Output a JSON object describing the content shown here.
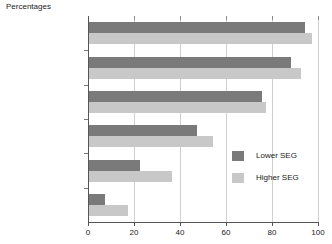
{
  "chart_data": {
    "type": "bar",
    "orientation": "horizontal",
    "title": "Percentages",
    "xlabel": "",
    "ylabel": "",
    "xlim": [
      0,
      100
    ],
    "xticks": [
      0,
      20,
      40,
      60,
      80,
      100
    ],
    "xtick_labels": [
      "0",
      "20",
      "40",
      "60",
      "80",
      "100"
    ],
    "grid": true,
    "legend_position": "inside-right",
    "categories": [
      "A level points 25 or more",
      "A level points 13 to 24",
      "A level points 12 or less",
      "Vocational Level 3",
      "Level 2",
      "Lower than Level 2"
    ],
    "category_lines": [
      [
        "A level points 25",
        "or more"
      ],
      [
        "A level points 13",
        "to 24"
      ],
      [
        "A level points 12",
        "or less"
      ],
      [
        "Vocational Level 3"
      ],
      [
        "Level 2"
      ],
      [
        "Lower than Level 2"
      ]
    ],
    "series": [
      {
        "name": "Lower SEG",
        "color": "#7a7a7a",
        "values": [
          94,
          88,
          75,
          47,
          22,
          7
        ]
      },
      {
        "name": "Higher SEG",
        "color": "#c8c8c8",
        "values": [
          97,
          92,
          77,
          54,
          36,
          17
        ]
      }
    ]
  },
  "legend": {
    "items": [
      {
        "label": "Lower SEG"
      },
      {
        "label": "Higher SEG"
      }
    ]
  }
}
